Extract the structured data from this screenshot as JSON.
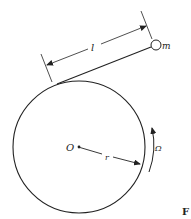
{
  "diagram": {
    "type": "physics-diagram",
    "labels": {
      "center": "O",
      "radius": "r",
      "length": "l",
      "mass": "m",
      "angular_velocity": "Ω",
      "figure_tag": "F"
    },
    "colors": {
      "stroke": "#222222",
      "background": "#ffffff"
    }
  }
}
